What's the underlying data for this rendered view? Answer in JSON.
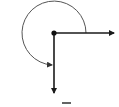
{
  "diagram": {
    "type": "angle",
    "vertex": {
      "x": 54,
      "y": 33
    },
    "rays": [
      {
        "name": "initial-side",
        "direction": "right",
        "end": {
          "x": 114,
          "y": 33
        }
      },
      {
        "name": "terminal-side",
        "direction": "down",
        "end": {
          "x": 54,
          "y": 93
        }
      }
    ],
    "arc": {
      "radius": 32,
      "direction": "counterclockwise",
      "degrees": 270
    },
    "label": "",
    "colors": {
      "stroke": "#1a1a1a",
      "arc": "#555555",
      "background": "#ffffff"
    }
  }
}
